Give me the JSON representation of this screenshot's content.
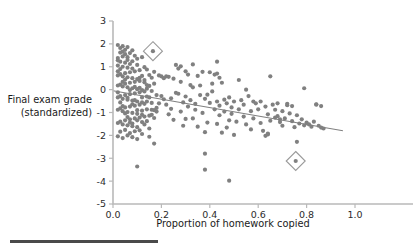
{
  "chart_data": {
    "type": "scatter",
    "title": "",
    "xlabel": "Proportion of homework copied",
    "ylabel": "Final exam grade (standardized)",
    "ylabel_line1": "Final exam grade",
    "ylabel_line2": "(standardized)",
    "xlim": [
      0.0,
      1.0
    ],
    "ylim": [
      -5,
      3
    ],
    "xticks": [
      0.0,
      0.2,
      0.4,
      0.6,
      0.8,
      1.0
    ],
    "xtick_labels": [
      "0.0",
      "0.2",
      "0.4",
      "0.6",
      "0.8",
      "1.0"
    ],
    "yticks": [
      3,
      2,
      1,
      0,
      -1,
      -2,
      -3,
      -4,
      -5
    ],
    "ytick_labels": [
      "3",
      "2",
      "1",
      "0",
      "-1",
      "-2",
      "-3",
      "-4",
      "-5"
    ],
    "grid": false,
    "legend": null,
    "point_color": "#808080",
    "line_color": "#808080",
    "marker_color": "#9a9a9a",
    "trend_line": {
      "type": "linear-fit",
      "x_start": 0.0,
      "y_start": -0.05,
      "x_end": 0.95,
      "y_end": -1.8
    },
    "highlight_markers": [
      {
        "shape": "diamond",
        "x": 0.165,
        "y": 1.68
      },
      {
        "shape": "diamond",
        "x": 0.755,
        "y": -3.12
      }
    ],
    "points": [
      [
        0.02,
        1.95
      ],
      [
        0.03,
        1.82
      ],
      [
        0.04,
        1.9
      ],
      [
        0.05,
        1.74
      ],
      [
        0.03,
        1.62
      ],
      [
        0.05,
        1.55
      ],
      [
        0.06,
        1.86
      ],
      [
        0.07,
        1.6
      ],
      [
        0.04,
        1.45
      ],
      [
        0.02,
        1.38
      ],
      [
        0.06,
        1.3
      ],
      [
        0.08,
        1.72
      ],
      [
        0.09,
        1.48
      ],
      [
        0.1,
        1.35
      ],
      [
        0.03,
        1.22
      ],
      [
        0.05,
        1.18
      ],
      [
        0.07,
        1.12
      ],
      [
        0.02,
        1.05
      ],
      [
        0.04,
        1.0
      ],
      [
        0.06,
        0.96
      ],
      [
        0.08,
        0.92
      ],
      [
        0.1,
        1.08
      ],
      [
        0.12,
        1.42
      ],
      [
        0.13,
        0.98
      ],
      [
        0.11,
        0.85
      ],
      [
        0.09,
        0.8
      ],
      [
        0.07,
        0.76
      ],
      [
        0.05,
        0.72
      ],
      [
        0.03,
        0.68
      ],
      [
        0.02,
        0.62
      ],
      [
        0.04,
        0.58
      ],
      [
        0.06,
        0.54
      ],
      [
        0.08,
        0.5
      ],
      [
        0.1,
        0.46
      ],
      [
        0.12,
        0.6
      ],
      [
        0.14,
        0.88
      ],
      [
        0.15,
        0.64
      ],
      [
        0.13,
        0.42
      ],
      [
        0.11,
        0.38
      ],
      [
        0.09,
        0.34
      ],
      [
        0.07,
        0.3
      ],
      [
        0.05,
        0.26
      ],
      [
        0.03,
        0.22
      ],
      [
        0.02,
        0.18
      ],
      [
        0.04,
        0.14
      ],
      [
        0.06,
        0.1
      ],
      [
        0.08,
        0.06
      ],
      [
        0.1,
        0.02
      ],
      [
        0.12,
        -0.02
      ],
      [
        0.14,
        0.2
      ],
      [
        0.16,
        0.52
      ],
      [
        0.15,
        0.16
      ],
      [
        0.13,
        -0.08
      ],
      [
        0.11,
        -0.12
      ],
      [
        0.09,
        -0.16
      ],
      [
        0.07,
        -0.2
      ],
      [
        0.05,
        -0.24
      ],
      [
        0.03,
        -0.28
      ],
      [
        0.02,
        -0.34
      ],
      [
        0.04,
        -0.4
      ],
      [
        0.06,
        -0.44
      ],
      [
        0.08,
        -0.48
      ],
      [
        0.1,
        -0.52
      ],
      [
        0.12,
        -0.56
      ],
      [
        0.14,
        -0.3
      ],
      [
        0.16,
        -0.06
      ],
      [
        0.17,
        0.26
      ],
      [
        0.15,
        -0.34
      ],
      [
        0.13,
        -0.62
      ],
      [
        0.11,
        -0.66
      ],
      [
        0.09,
        -0.7
      ],
      [
        0.07,
        -0.74
      ],
      [
        0.05,
        -0.78
      ],
      [
        0.03,
        -0.82
      ],
      [
        0.02,
        -0.88
      ],
      [
        0.04,
        -0.94
      ],
      [
        0.06,
        -0.98
      ],
      [
        0.08,
        -1.02
      ],
      [
        0.1,
        -1.06
      ],
      [
        0.12,
        -1.1
      ],
      [
        0.14,
        -0.86
      ],
      [
        0.16,
        -0.58
      ],
      [
        0.18,
        -0.24
      ],
      [
        0.17,
        -0.9
      ],
      [
        0.15,
        -1.14
      ],
      [
        0.13,
        -1.18
      ],
      [
        0.11,
        -1.22
      ],
      [
        0.09,
        -1.26
      ],
      [
        0.07,
        -1.3
      ],
      [
        0.05,
        -1.34
      ],
      [
        0.03,
        -1.4
      ],
      [
        0.02,
        -1.46
      ],
      [
        0.04,
        -1.52
      ],
      [
        0.06,
        -1.56
      ],
      [
        0.08,
        -1.6
      ],
      [
        0.1,
        -1.64
      ],
      [
        0.12,
        -1.42
      ],
      [
        0.14,
        -1.38
      ],
      [
        0.16,
        -1.1
      ],
      [
        0.18,
        -0.8
      ],
      [
        0.05,
        -1.76
      ],
      [
        0.03,
        -1.84
      ],
      [
        0.07,
        -1.9
      ],
      [
        0.09,
        -1.82
      ],
      [
        0.11,
        -1.78
      ],
      [
        0.06,
        -2.0
      ],
      [
        0.08,
        -2.08
      ],
      [
        0.04,
        -2.12
      ],
      [
        0.1,
        -2.16
      ],
      [
        0.12,
        -1.94
      ],
      [
        0.02,
        1.28
      ],
      [
        0.04,
        1.66
      ],
      [
        0.06,
        1.42
      ],
      [
        0.08,
        1.24
      ],
      [
        0.03,
        0.9
      ],
      [
        0.05,
        0.44
      ],
      [
        0.07,
        -0.02
      ],
      [
        0.09,
        0.12
      ],
      [
        0.11,
        0.52
      ],
      [
        0.02,
        0.8
      ],
      [
        0.04,
        0.34
      ],
      [
        0.06,
        -0.36
      ],
      [
        0.08,
        -0.64
      ],
      [
        0.1,
        -0.9
      ],
      [
        0.12,
        -0.34
      ],
      [
        0.14,
        0.04
      ],
      [
        0.03,
        -0.56
      ],
      [
        0.05,
        -1.04
      ],
      [
        0.07,
        -1.44
      ],
      [
        0.09,
        -0.46
      ],
      [
        0.11,
        0.08
      ],
      [
        0.13,
        0.32
      ],
      [
        0.02,
        -0.12
      ],
      [
        0.04,
        -0.72
      ],
      [
        0.06,
        -1.2
      ],
      [
        0.08,
        -1.48
      ],
      [
        0.1,
        -1.34
      ],
      [
        0.12,
        -0.92
      ],
      [
        0.14,
        -0.52
      ],
      [
        0.16,
        -0.88
      ],
      [
        0.13,
        -1.52
      ],
      [
        0.15,
        -1.7
      ],
      [
        0.17,
        -1.24
      ],
      [
        0.18,
        -0.96
      ],
      [
        0.19,
        -0.6
      ],
      [
        0.2,
        -0.28
      ],
      [
        0.21,
        0.5
      ],
      [
        0.19,
        0.62
      ],
      [
        0.17,
        0.78
      ],
      [
        0.2,
        0.58
      ],
      [
        0.22,
        0.58
      ],
      [
        0.23,
        0.56
      ],
      [
        0.21,
        -0.42
      ],
      [
        0.22,
        -0.66
      ],
      [
        0.24,
        -0.84
      ],
      [
        0.23,
        -1.08
      ],
      [
        0.25,
        -1.32
      ],
      [
        0.24,
        -0.38
      ],
      [
        0.26,
        -0.14
      ],
      [
        0.25,
        0.48
      ],
      [
        0.27,
        0.92
      ],
      [
        0.26,
        1.08
      ],
      [
        0.28,
        0.34
      ],
      [
        0.27,
        -0.18
      ],
      [
        0.29,
        -0.56
      ],
      [
        0.28,
        -0.96
      ],
      [
        0.3,
        -1.28
      ],
      [
        0.29,
        -1.58
      ],
      [
        0.31,
        -0.74
      ],
      [
        0.3,
        -0.3
      ],
      [
        0.32,
        0.2
      ],
      [
        0.31,
        0.66
      ],
      [
        0.33,
        0.1
      ],
      [
        0.32,
        -0.46
      ],
      [
        0.34,
        -0.88
      ],
      [
        0.33,
        -1.26
      ],
      [
        0.35,
        -1.62
      ],
      [
        0.34,
        -0.62
      ],
      [
        0.36,
        -0.24
      ],
      [
        0.35,
        0.6
      ],
      [
        0.37,
        0.78
      ],
      [
        0.36,
        0.18
      ],
      [
        0.38,
        -0.4
      ],
      [
        0.37,
        -1.02
      ],
      [
        0.39,
        -1.44
      ],
      [
        0.38,
        -1.86
      ],
      [
        0.4,
        -0.58
      ],
      [
        0.39,
        -0.22
      ],
      [
        0.41,
        0.26
      ],
      [
        0.4,
        0.76
      ],
      [
        0.42,
        0.66
      ],
      [
        0.41,
        -0.08
      ],
      [
        0.43,
        -0.52
      ],
      [
        0.42,
        -0.86
      ],
      [
        0.44,
        -1.12
      ],
      [
        0.43,
        -1.5
      ],
      [
        0.45,
        -1.88
      ],
      [
        0.44,
        -0.7
      ],
      [
        0.46,
        -0.44
      ],
      [
        0.45,
        0.3
      ],
      [
        0.43,
        1.22
      ],
      [
        0.47,
        -0.6
      ],
      [
        0.46,
        -0.96
      ],
      [
        0.48,
        -1.34
      ],
      [
        0.47,
        -1.66
      ],
      [
        0.49,
        -0.78
      ],
      [
        0.48,
        -0.34
      ],
      [
        0.5,
        -0.52
      ],
      [
        0.49,
        -1.06
      ],
      [
        0.51,
        -1.4
      ],
      [
        0.52,
        -0.86
      ],
      [
        0.53,
        -0.46
      ],
      [
        0.52,
        0.42
      ],
      [
        0.54,
        -1.18
      ],
      [
        0.55,
        -1.52
      ],
      [
        0.54,
        -0.66
      ],
      [
        0.56,
        -0.28
      ],
      [
        0.57,
        -0.94
      ],
      [
        0.58,
        -1.26
      ],
      [
        0.57,
        -1.74
      ],
      [
        0.59,
        -0.6
      ],
      [
        0.6,
        -0.86
      ],
      [
        0.61,
        -1.46
      ],
      [
        0.62,
        -1.8
      ],
      [
        0.61,
        -0.52
      ],
      [
        0.63,
        -0.74
      ],
      [
        0.64,
        -1.08
      ],
      [
        0.65,
        -1.36
      ],
      [
        0.64,
        -1.92
      ],
      [
        0.66,
        -0.66
      ],
      [
        0.65,
        0.58
      ],
      [
        0.67,
        -0.88
      ],
      [
        0.68,
        -1.16
      ],
      [
        0.69,
        -1.42
      ],
      [
        0.68,
        -0.6
      ],
      [
        0.7,
        -0.94
      ],
      [
        0.71,
        -1.26
      ],
      [
        0.7,
        -1.58
      ],
      [
        0.72,
        -0.68
      ],
      [
        0.73,
        -1.04
      ],
      [
        0.74,
        -1.38
      ],
      [
        0.75,
        -1.64
      ],
      [
        0.74,
        -0.72
      ],
      [
        0.76,
        -1.12
      ],
      [
        0.77,
        -1.48
      ],
      [
        0.76,
        -2.28
      ],
      [
        0.78,
        -1.3
      ],
      [
        0.79,
        -1.56
      ],
      [
        0.8,
        -1.44
      ],
      [
        0.79,
        0.06
      ],
      [
        0.81,
        -1.52
      ],
      [
        0.82,
        -1.62
      ],
      [
        0.83,
        -1.4
      ],
      [
        0.84,
        -0.64
      ],
      [
        0.85,
        -1.58
      ],
      [
        0.86,
        -1.66
      ],
      [
        0.87,
        -1.7
      ],
      [
        0.38,
        -2.8
      ],
      [
        0.38,
        -3.5
      ],
      [
        0.48,
        -3.98
      ],
      [
        0.1,
        -3.36
      ],
      [
        0.17,
        -2.36
      ],
      [
        0.15,
        -2.06
      ],
      [
        0.02,
        -2.04
      ],
      [
        0.63,
        -2.02
      ],
      [
        0.64,
        -1.96
      ],
      [
        0.5,
        -1.98
      ],
      [
        0.43,
        0.7
      ],
      [
        0.44,
        0.52
      ],
      [
        0.33,
        1.1
      ],
      [
        0.3,
        0.8
      ],
      [
        0.28,
        1.02
      ],
      [
        0.55,
        0.0
      ],
      [
        0.58,
        -0.52
      ],
      [
        0.67,
        -1.22
      ],
      [
        0.69,
        -1.3
      ],
      [
        0.72,
        -0.62
      ],
      [
        0.84,
        -0.66
      ],
      [
        0.86,
        -0.72
      ]
    ]
  }
}
